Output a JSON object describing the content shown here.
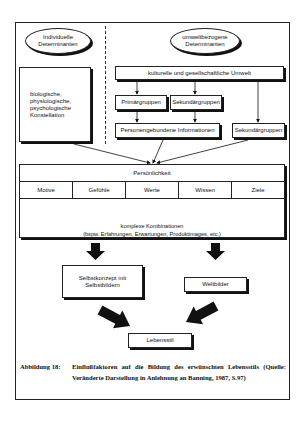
{
  "diagram": {
    "left_header": "Individuelle Determinanten",
    "right_header": "umweltbezogene Determinanten",
    "individual_box": "biologische, physiologische, psychologische Konstellation",
    "culture_box": "kulturelle und gesellschaftliche Umwelt",
    "primary_groups": "Primärgruppen",
    "secondary_groups": "Sekundärgruppen",
    "secondary_groups_right": "Sekundärgruppen",
    "person_info": "Personengebundene Informationen",
    "personality": {
      "title": "Persönlichkeit",
      "traits": [
        "Motive",
        "Gefühle",
        "Werte",
        "Wissen",
        "Ziele"
      ],
      "complex_line1": "komplexe Kombinationen",
      "complex_line2": "(bspw. Erfahrungen, Erwartungen, Produktimages, etc.)"
    },
    "self_concept": "Selbstkonzept mit Selbstbildern",
    "world_views": "Weltbilder",
    "lifestyle": "Lebensstil"
  },
  "caption": {
    "label": "Abbildung 18:",
    "text": "Einflußfaktoren auf die Bildung des erwünschten Lebensstils (Quelle: Veränderte Darstellung in Anlehnung an Banning, 1987, S.97)"
  }
}
